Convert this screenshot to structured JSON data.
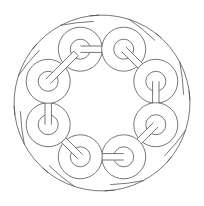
{
  "figure": {
    "type": "celtic-knot-line-art",
    "width": 204,
    "height": 206,
    "background": "#ffffff",
    "stroke_color": "#4a4a4a",
    "center": [
      102,
      103
    ],
    "ring_count": 8,
    "ring_orbit_radius": 58,
    "ring_outer_radius": 22,
    "ring_inner_radius": 10,
    "outer_arc_radius": 90,
    "ring_angles_deg": [
      -112,
      -68,
      -22,
      22,
      68,
      112,
      158,
      202
    ]
  }
}
